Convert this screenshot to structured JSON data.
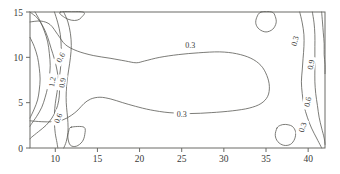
{
  "chart_data": {
    "type": "line",
    "title": "",
    "xlabel": "",
    "ylabel": "",
    "xlim": [
      7,
      42
    ],
    "ylim": [
      0,
      15
    ],
    "grid": false,
    "legend": null,
    "plot_style": "contour",
    "xticks": [
      10,
      15,
      20,
      25,
      30,
      35,
      40
    ],
    "xticklabels": [
      "10",
      "15",
      "20",
      "25",
      "30",
      "35",
      "40"
    ],
    "yticks": [
      0,
      5,
      10,
      15
    ],
    "yticklabels": [
      "0",
      "5",
      "10",
      "15"
    ],
    "contour_levels": [
      0.3,
      0.6,
      0.9,
      1.2
    ],
    "contour_labels": [
      {
        "id": "label-center-upper",
        "text": "0.3",
        "x": 26.0,
        "y": 11.4,
        "rotation": 0
      },
      {
        "id": "label-center-lower",
        "text": "0.3",
        "x": 25.0,
        "y": 3.7,
        "rotation": 0
      },
      {
        "id": "label-left-06-upper",
        "text": "0.6",
        "x": 10.6,
        "y": 10.0,
        "rotation": -62
      },
      {
        "id": "label-left-12",
        "text": "1.2",
        "x": 9.6,
        "y": 7.3,
        "rotation": -80
      },
      {
        "id": "label-left-09",
        "text": "0.9",
        "x": 10.8,
        "y": 7.2,
        "rotation": -82
      },
      {
        "id": "label-left-06-lower",
        "text": "0.6",
        "x": 10.3,
        "y": 3.3,
        "rotation": -68
      },
      {
        "id": "label-right-03-upper",
        "text": "0.3",
        "x": 38.4,
        "y": 11.8,
        "rotation": -75
      },
      {
        "id": "label-right-09",
        "text": "0.9",
        "x": 40.3,
        "y": 9.2,
        "rotation": -78
      },
      {
        "id": "label-right-06",
        "text": "0.6",
        "x": 39.9,
        "y": 5.1,
        "rotation": -78
      },
      {
        "id": "label-right-03-lower",
        "text": "0.3",
        "x": 39.3,
        "y": 2.3,
        "rotation": -72
      }
    ],
    "series": [
      {
        "name": "contour-0.3-central",
        "level": 0.3,
        "comment": "large central lobe spanning most of the domain",
        "points": [
          [
            7.0,
            13.9
          ],
          [
            8.3,
            14.0
          ],
          [
            9.4,
            13.6
          ],
          [
            10.3,
            12.5
          ],
          [
            11.2,
            11.4
          ],
          [
            12.6,
            10.7
          ],
          [
            14.5,
            10.2
          ],
          [
            16.5,
            9.9
          ],
          [
            18.3,
            9.6
          ],
          [
            19.6,
            9.4
          ],
          [
            20.6,
            9.6
          ],
          [
            22.4,
            10.0
          ],
          [
            24.6,
            10.3
          ],
          [
            27.0,
            10.5
          ],
          [
            29.5,
            10.6
          ],
          [
            31.5,
            10.4
          ],
          [
            33.2,
            9.9
          ],
          [
            34.4,
            9.1
          ],
          [
            35.1,
            8.0
          ],
          [
            35.4,
            6.8
          ],
          [
            35.2,
            5.7
          ],
          [
            34.4,
            4.9
          ],
          [
            33.0,
            4.4
          ],
          [
            31.0,
            4.1
          ],
          [
            28.5,
            3.9
          ],
          [
            26.0,
            3.8
          ],
          [
            23.5,
            3.9
          ],
          [
            21.3,
            4.2
          ],
          [
            19.5,
            4.6
          ],
          [
            18.0,
            5.0
          ],
          [
            16.6,
            5.4
          ],
          [
            15.3,
            5.6
          ],
          [
            14.2,
            5.4
          ],
          [
            13.4,
            4.9
          ],
          [
            12.7,
            4.2
          ],
          [
            11.9,
            3.6
          ],
          [
            10.9,
            3.1
          ],
          [
            9.7,
            2.9
          ],
          [
            8.4,
            2.9
          ],
          [
            7.0,
            3.0
          ]
        ]
      },
      {
        "name": "contour-0.6-left",
        "level": 0.6,
        "points": [
          [
            7.0,
            15.0
          ],
          [
            7.9,
            14.3
          ],
          [
            8.6,
            13.3
          ],
          [
            9.1,
            12.2
          ],
          [
            9.5,
            11.0
          ],
          [
            9.9,
            9.8
          ],
          [
            10.2,
            8.6
          ],
          [
            10.4,
            7.4
          ],
          [
            10.5,
            6.3
          ],
          [
            10.4,
            5.2
          ],
          [
            10.1,
            4.2
          ],
          [
            9.6,
            3.3
          ],
          [
            8.9,
            2.5
          ],
          [
            8.0,
            1.8
          ],
          [
            7.2,
            1.2
          ],
          [
            7.0,
            1.0
          ]
        ]
      },
      {
        "name": "contour-0.9-left",
        "level": 0.9,
        "points": [
          [
            7.6,
            15.0
          ],
          [
            8.2,
            14.0
          ],
          [
            8.7,
            12.9
          ],
          [
            9.1,
            11.7
          ],
          [
            9.3,
            10.4
          ],
          [
            9.4,
            9.1
          ],
          [
            9.3,
            7.9
          ],
          [
            9.1,
            6.7
          ],
          [
            8.8,
            5.6
          ],
          [
            8.4,
            4.5
          ],
          [
            7.8,
            3.5
          ],
          [
            7.2,
            2.7
          ],
          [
            7.0,
            2.4
          ]
        ]
      },
      {
        "name": "contour-1.2-left",
        "level": 1.2,
        "points": [
          [
            7.0,
            12.2
          ],
          [
            7.5,
            11.2
          ],
          [
            7.9,
            10.0
          ],
          [
            8.1,
            8.8
          ],
          [
            8.2,
            7.6
          ],
          [
            8.1,
            6.4
          ],
          [
            7.9,
            5.3
          ],
          [
            7.5,
            4.3
          ],
          [
            7.1,
            3.5
          ],
          [
            7.0,
            3.3
          ]
        ]
      },
      {
        "name": "contour-0.6-left-outer",
        "level": 0.6,
        "comment": "outer 0.6 re-entrant branch running to the bottom axis",
        "points": [
          [
            11.0,
            15.0
          ],
          [
            11.5,
            13.9
          ],
          [
            11.8,
            12.6
          ],
          [
            11.9,
            11.3
          ],
          [
            11.8,
            10.0
          ],
          [
            11.6,
            8.7
          ],
          [
            11.4,
            7.4
          ],
          [
            11.3,
            6.2
          ],
          [
            11.3,
            5.0
          ],
          [
            11.4,
            3.9
          ],
          [
            11.5,
            2.8
          ],
          [
            11.5,
            1.7
          ],
          [
            11.3,
            0.7
          ],
          [
            11.0,
            0.0
          ]
        ]
      },
      {
        "name": "contour-0.9-left-outer",
        "level": 0.9,
        "points": [
          [
            9.9,
            15.0
          ],
          [
            10.3,
            13.8
          ],
          [
            10.6,
            12.5
          ],
          [
            10.7,
            11.2
          ],
          [
            10.7,
            9.9
          ],
          [
            10.6,
            8.6
          ],
          [
            10.4,
            7.3
          ],
          [
            10.2,
            6.1
          ],
          [
            10.0,
            4.9
          ],
          [
            9.9,
            3.8
          ],
          [
            9.9,
            2.7
          ],
          [
            10.0,
            1.6
          ],
          [
            10.2,
            0.6
          ],
          [
            10.3,
            0.0
          ]
        ]
      },
      {
        "name": "contour-0.3-right-a",
        "level": 0.3,
        "points": [
          [
            39.0,
            15.0
          ],
          [
            39.3,
            13.8
          ],
          [
            39.5,
            12.5
          ],
          [
            39.5,
            11.2
          ],
          [
            39.4,
            9.9
          ],
          [
            39.3,
            8.6
          ],
          [
            39.2,
            7.3
          ],
          [
            39.3,
            6.0
          ],
          [
            39.5,
            4.7
          ],
          [
            39.9,
            3.4
          ],
          [
            40.4,
            2.2
          ],
          [
            41.0,
            1.1
          ],
          [
            41.5,
            0.2
          ],
          [
            41.6,
            0.0
          ]
        ]
      },
      {
        "name": "contour-0.6-right",
        "level": 0.6,
        "points": [
          [
            40.5,
            15.0
          ],
          [
            40.7,
            13.8
          ],
          [
            40.8,
            12.5
          ],
          [
            40.8,
            11.2
          ],
          [
            40.8,
            9.9
          ],
          [
            40.8,
            8.6
          ],
          [
            40.8,
            7.3
          ],
          [
            40.9,
            6.0
          ],
          [
            41.1,
            4.7
          ],
          [
            41.3,
            3.4
          ],
          [
            41.6,
            2.2
          ],
          [
            41.9,
            1.1
          ],
          [
            42.0,
            0.4
          ]
        ]
      },
      {
        "name": "contour-0.9-right",
        "level": 0.9,
        "points": [
          [
            41.6,
            15.0
          ],
          [
            41.7,
            13.9
          ],
          [
            41.8,
            12.7
          ],
          [
            41.9,
            11.5
          ],
          [
            41.9,
            10.3
          ],
          [
            42.0,
            9.2
          ],
          [
            42.0,
            8.2
          ]
        ]
      },
      {
        "name": "blob-top-left",
        "level": 0.3,
        "closed": true,
        "points": [
          [
            10.6,
            15.0
          ],
          [
            11.1,
            14.4
          ],
          [
            11.9,
            14.1
          ],
          [
            12.6,
            14.1
          ],
          [
            13.1,
            14.4
          ],
          [
            13.3,
            15.0
          ]
        ]
      },
      {
        "name": "blob-top-right",
        "level": 0.3,
        "closed": true,
        "points": [
          [
            34.4,
            15.0
          ],
          [
            33.9,
            14.4
          ],
          [
            33.8,
            13.7
          ],
          [
            34.2,
            13.1
          ],
          [
            35.0,
            12.8
          ],
          [
            35.8,
            13.1
          ],
          [
            36.2,
            13.8
          ],
          [
            36.1,
            14.5
          ],
          [
            35.7,
            15.0
          ]
        ]
      },
      {
        "name": "blob-bottom-left",
        "level": 0.3,
        "closed": true,
        "points": [
          [
            11.9,
            2.3
          ],
          [
            13.4,
            2.3
          ],
          [
            13.5,
            1.5
          ],
          [
            13.2,
            0.7
          ],
          [
            12.5,
            0.2
          ],
          [
            11.8,
            0.3
          ],
          [
            11.5,
            1.1
          ],
          [
            11.6,
            1.9
          ]
        ]
      },
      {
        "name": "blob-bottom-right",
        "level": 0.3,
        "closed": true,
        "points": [
          [
            36.3,
            2.2
          ],
          [
            36.1,
            1.4
          ],
          [
            36.4,
            0.7
          ],
          [
            37.1,
            0.3
          ],
          [
            37.9,
            0.4
          ],
          [
            38.4,
            1.0
          ],
          [
            38.5,
            1.8
          ],
          [
            38.1,
            2.4
          ],
          [
            37.3,
            2.6
          ],
          [
            36.7,
            2.5
          ]
        ]
      }
    ]
  },
  "axes": {
    "frame_name": "plot-frame",
    "x_axis_name": "x-axis",
    "y_axis_name": "y-axis"
  }
}
